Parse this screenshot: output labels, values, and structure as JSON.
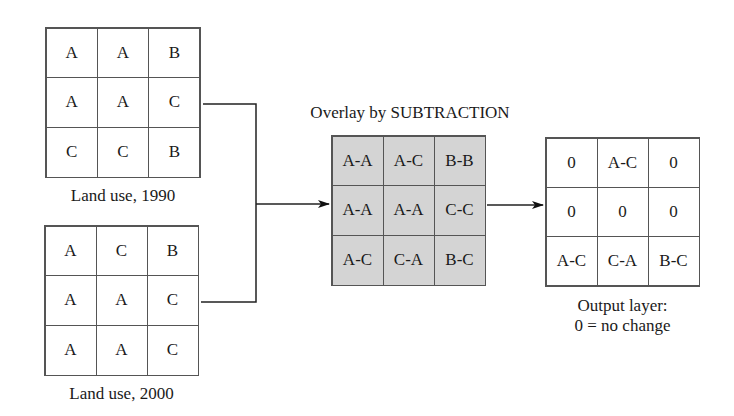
{
  "layers": {
    "land_use_1990": {
      "caption": "Land use, 1990",
      "cells": [
        [
          "A",
          "A",
          "B"
        ],
        [
          "A",
          "A",
          "C"
        ],
        [
          "C",
          "C",
          "B"
        ]
      ]
    },
    "land_use_2000": {
      "caption": "Land use, 2000",
      "cells": [
        [
          "A",
          "C",
          "B"
        ],
        [
          "A",
          "A",
          "C"
        ],
        [
          "A",
          "A",
          "C"
        ]
      ]
    },
    "overlay": {
      "title": "Overlay by SUBTRACTION",
      "fill_color": "#d4d4d4",
      "cells": [
        [
          "A-A",
          "A-C",
          "B-B"
        ],
        [
          "A-A",
          "A-A",
          "C-C"
        ],
        [
          "A-C",
          "C-A",
          "B-C"
        ]
      ]
    },
    "output": {
      "caption_line1": "Output layer:",
      "caption_line2": "0 = no change",
      "cells": [
        [
          "0",
          "A-C",
          "0"
        ],
        [
          "0",
          "0",
          "0"
        ],
        [
          "A-C",
          "C-A",
          "B-C"
        ]
      ]
    }
  }
}
